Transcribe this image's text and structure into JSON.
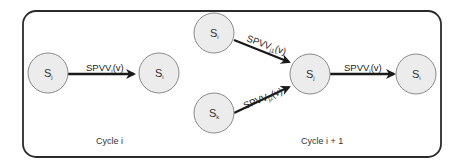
{
  "diagram": {
    "frame": {
      "stroke": "#2a2a2a",
      "background": "#ffffff"
    },
    "cycles": [
      {
        "caption": "Cycle i",
        "nodes": [
          {
            "id": "sj_left",
            "base": "S",
            "sub": "j"
          },
          {
            "id": "si_left",
            "base": "S",
            "sub": "i"
          }
        ],
        "edges": [
          {
            "from": "sj_left",
            "to": "si_left",
            "label_base": "SPVV",
            "label_sub": "j",
            "label_suffix": "(v)"
          }
        ]
      },
      {
        "caption": "Cycle i + 1",
        "nodes": [
          {
            "id": "si_top",
            "base": "S",
            "sub": "i"
          },
          {
            "id": "sk",
            "base": "S",
            "sub": "k"
          },
          {
            "id": "sj_center",
            "base": "S",
            "sub": "j"
          },
          {
            "id": "si_right",
            "base": "S",
            "sub": "i"
          }
        ],
        "edges": [
          {
            "from": "si_top",
            "to": "sj_center",
            "label_base": "SPVV",
            "label_sub": "j1",
            "label_suffix": "(v)"
          },
          {
            "from": "sk",
            "to": "sj_center",
            "label_base": "SPVV",
            "label_sub": "j2",
            "label_suffix": "(v)"
          },
          {
            "from": "sj_center",
            "to": "si_right",
            "label_base": "SPVV",
            "label_sub": "j",
            "label_suffix": "(v)"
          }
        ]
      }
    ]
  }
}
